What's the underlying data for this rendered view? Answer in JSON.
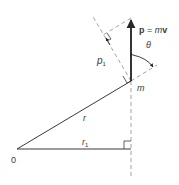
{
  "diagram": {
    "title": "",
    "type": "vector geometry — angular momentum",
    "colors": {
      "line": "#3a3a3a",
      "dashed": "#8a8a8a",
      "background": "#ffffff"
    },
    "labels": {
      "origin": "0",
      "r": "r",
      "r1_main": "r",
      "r1_sub": "1",
      "p1_main": "p",
      "p1_sub": "1",
      "mass": "m",
      "theta": "θ",
      "momentum_p": "p",
      "momentum_eq": " = ",
      "momentum_m": "m",
      "momentum_v": "v"
    },
    "points": {
      "origin": [
        17,
        149
      ],
      "mass": [
        131,
        81
      ],
      "momentum_tip": [
        131,
        18
      ],
      "p1_foot": [
        103,
        35
      ],
      "r1_foot": [
        131,
        149
      ]
    },
    "elements": [
      {
        "name": "r-vector",
        "from": "origin",
        "to": "mass",
        "style": "solid"
      },
      {
        "name": "r1-line",
        "from": "origin",
        "to": "r1_foot",
        "style": "solid"
      },
      {
        "name": "momentum-vector",
        "from": "mass",
        "to": "momentum_tip",
        "style": "arrow"
      },
      {
        "name": "line-of-action",
        "style": "dashed",
        "vertical_through": "mass"
      },
      {
        "name": "r-extension",
        "style": "dashed"
      },
      {
        "name": "perpendicular-to-r",
        "style": "dashed"
      },
      {
        "name": "p1-projection",
        "style": "dashed"
      },
      {
        "name": "theta-arc",
        "style": "arrow-arc"
      }
    ]
  }
}
